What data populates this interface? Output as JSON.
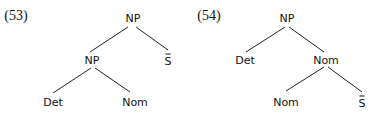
{
  "trees": [
    {
      "label": "(53)",
      "nodes": {
        "root": "NP",
        "np": "NP",
        "sbar": "S",
        "det": "Det",
        "nom": "Nom"
      },
      "structure": "[NP [NP Det Nom] S-bar]"
    },
    {
      "label": "(54)",
      "nodes": {
        "root": "NP",
        "det": "Det",
        "nom": "Nom",
        "nom2": "Nom",
        "sbar": "S"
      },
      "structure": "[NP Det [Nom Nom S-bar]]"
    }
  ]
}
